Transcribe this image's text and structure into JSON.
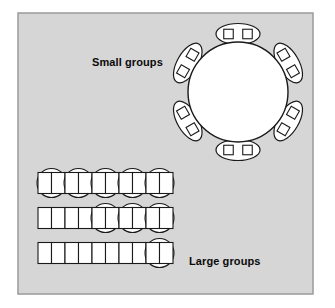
{
  "diagram": {
    "title_small": "Small groups",
    "title_large": "Large groups",
    "canvas": {
      "width": 335,
      "height": 308
    },
    "panel": {
      "name": "seating-layout-panel",
      "x": 18,
      "y": 13,
      "width": 295,
      "height": 281,
      "fill": "#d6d6d6",
      "stroke": "#9a9a9a",
      "stroke_width": 1.5
    },
    "colors": {
      "background": "#ffffff",
      "panel_fill": "#d6d6d6",
      "panel_border": "#9a9a9a",
      "table_fill": "#ffffff",
      "table_stroke": "#1a1a1a",
      "chair_fill": "#ffffff",
      "chair_stroke": "#1a1a1a",
      "label_text": "#0a0a0a"
    },
    "round_table": {
      "name": "round-table",
      "cx": 238,
      "cy": 92,
      "r": 50,
      "seat_count": 12,
      "pod_count": 6,
      "pods": [
        {
          "name": "chair-pod-top",
          "angle": -90,
          "seats": 2
        },
        {
          "name": "chair-pod-upper-right",
          "angle": -30,
          "seats": 2
        },
        {
          "name": "chair-pod-lower-right",
          "angle": 30,
          "seats": 2
        },
        {
          "name": "chair-pod-bottom",
          "angle": 90,
          "seats": 2
        },
        {
          "name": "chair-pod-lower-left",
          "angle": 150,
          "seats": 2
        },
        {
          "name": "chair-pod-upper-left",
          "angle": -150,
          "seats": 2
        }
      ],
      "pod_rx": 22,
      "pod_ry": 10.5,
      "pod_offset": 58,
      "chair_size": 9.5,
      "chair_spread": 9.5
    },
    "banquet_rows": [
      {
        "name": "banquet-row-1",
        "y": 183,
        "x_start": 38,
        "cell_width": 13.5,
        "cell_height": 21,
        "plain_cells": 0,
        "round_units": 5,
        "unit_cells": 2,
        "round_radius": 14.5,
        "total_seats": 10
      },
      {
        "name": "banquet-row-2",
        "y": 218,
        "x_start": 38,
        "cell_width": 13.5,
        "cell_height": 21,
        "plain_cells": 4,
        "round_units": 3,
        "unit_cells": 2,
        "round_radius": 14.5,
        "total_seats": 10
      },
      {
        "name": "banquet-row-3",
        "y": 253,
        "x_start": 38,
        "cell_width": 13.5,
        "cell_height": 21,
        "plain_cells": 8,
        "round_units": 1,
        "unit_cells": 2,
        "round_radius": 14.5,
        "total_seats": 10
      }
    ]
  }
}
